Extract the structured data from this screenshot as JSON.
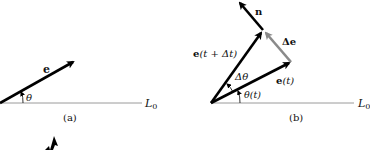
{
  "colors": {
    "vector": "#000000",
    "delta_vector": "#8a8a8a",
    "baseline": "#9a9a9a",
    "text": "#111111",
    "background": "#ffffff"
  },
  "panel_a": {
    "caption": "(a)",
    "vector_label": "e",
    "angle_label": "θ",
    "line_label_main": "L",
    "line_label_sub": "0"
  },
  "panel_b": {
    "caption": "(b)",
    "normal_label": "n",
    "delta_e_label": "Δe",
    "e_t_dt_label_bold": "e",
    "e_t_dt_label_rest": "(t + Δt)",
    "e_t_label_bold": "e",
    "e_t_label_rest": "(t)",
    "delta_theta_label": "Δθ",
    "theta_t_label": "θ(t)",
    "line_label_main": "L",
    "line_label_sub": "0"
  }
}
